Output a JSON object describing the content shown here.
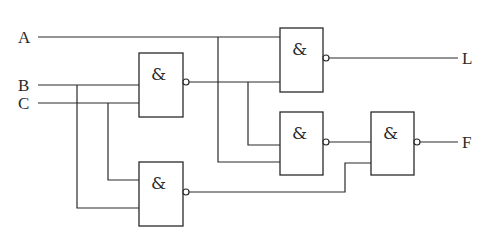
{
  "diagram": {
    "type": "logic-circuit",
    "inputs": [
      {
        "id": "A",
        "label": "A"
      },
      {
        "id": "B",
        "label": "B"
      },
      {
        "id": "C",
        "label": "C"
      }
    ],
    "outputs": [
      {
        "id": "L",
        "label": "L"
      },
      {
        "id": "F",
        "label": "F"
      }
    ],
    "gates": [
      {
        "id": "g1",
        "type": "NAND",
        "symbol": "&",
        "inputs": [
          "B",
          "C"
        ],
        "output": "n1"
      },
      {
        "id": "g2",
        "type": "NAND",
        "symbol": "&",
        "inputs": [
          "B",
          "C"
        ],
        "output": "n2"
      },
      {
        "id": "g3",
        "type": "NAND",
        "symbol": "&",
        "inputs": [
          "A",
          "n1"
        ],
        "output": "L"
      },
      {
        "id": "g4",
        "type": "NAND",
        "symbol": "&",
        "inputs": [
          "n1",
          "A"
        ],
        "output": "n4"
      },
      {
        "id": "g5",
        "type": "NAND",
        "symbol": "&",
        "inputs": [
          "n4",
          "n2"
        ],
        "output": "F"
      }
    ],
    "colors": {
      "line": "#2a2a2a",
      "background": "#ffffff"
    }
  }
}
